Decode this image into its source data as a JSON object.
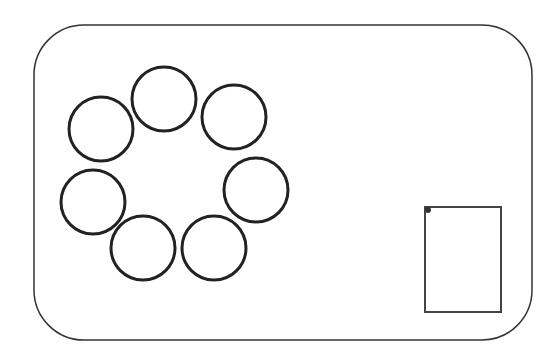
{
  "canvas": {
    "width": 560,
    "height": 364,
    "background": "#ffffff"
  },
  "frame": {
    "x": 34,
    "y": 25,
    "width": 498,
    "height": 315,
    "rx": 50,
    "stroke": "#333333",
    "stroke_width": 1.5
  },
  "circles": [
    {
      "id": "top",
      "cx": 164,
      "cy": 99,
      "r": 32
    },
    {
      "id": "top-right",
      "cx": 234,
      "cy": 117,
      "r": 32
    },
    {
      "id": "top-left",
      "cx": 101,
      "cy": 129,
      "r": 32
    },
    {
      "id": "right",
      "cx": 256,
      "cy": 190,
      "r": 32
    },
    {
      "id": "left",
      "cx": 93,
      "cy": 202,
      "r": 32
    },
    {
      "id": "bottom-left",
      "cx": 143,
      "cy": 248,
      "r": 32
    },
    {
      "id": "bottom-right",
      "cx": 214,
      "cy": 248,
      "r": 32
    }
  ],
  "circle_style": {
    "stroke": "#222222",
    "stroke_width": 3
  },
  "rectangle": {
    "x": 425,
    "y": 207,
    "width": 76,
    "height": 105,
    "stroke": "#444444",
    "stroke_width": 2
  },
  "corner_dot": {
    "cx": 428,
    "cy": 210,
    "r": 3,
    "fill": "#333333"
  }
}
